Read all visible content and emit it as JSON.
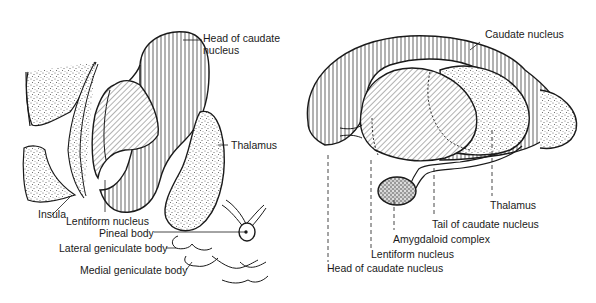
{
  "figures": [
    {
      "id": "left",
      "description": "horizontal section view",
      "labels": [
        {
          "key": "head_caudate",
          "text": "Head of caudate\nnucleus",
          "line1": "Head of caudate",
          "line2": "nucleus"
        },
        {
          "key": "thalamus",
          "text": "Thalamus"
        },
        {
          "key": "insula",
          "text": "Insula"
        },
        {
          "key": "lentiform",
          "text": "Lentiform nucleus"
        },
        {
          "key": "pineal",
          "text": "Pineal body"
        },
        {
          "key": "lateral_geniculate",
          "text": "Lateral geniculate body"
        },
        {
          "key": "medial_geniculate",
          "text": "Medial geniculate body"
        }
      ]
    },
    {
      "id": "right",
      "description": "lateral view",
      "labels": [
        {
          "key": "caudate",
          "text": "Caudate nucleus"
        },
        {
          "key": "thalamus",
          "text": "Thalamus"
        },
        {
          "key": "tail_caudate",
          "text": "Tail of caudate nucleus"
        },
        {
          "key": "amygdaloid",
          "text": "Amygdaloid complex"
        },
        {
          "key": "lentiform",
          "text": "Lentiform nucleus"
        },
        {
          "key": "head_caudate",
          "text": "Head of caudate nucleus"
        }
      ]
    }
  ],
  "colors": {
    "ink": "#1a1a1a",
    "background": "#ffffff",
    "stipple": "#555555"
  }
}
